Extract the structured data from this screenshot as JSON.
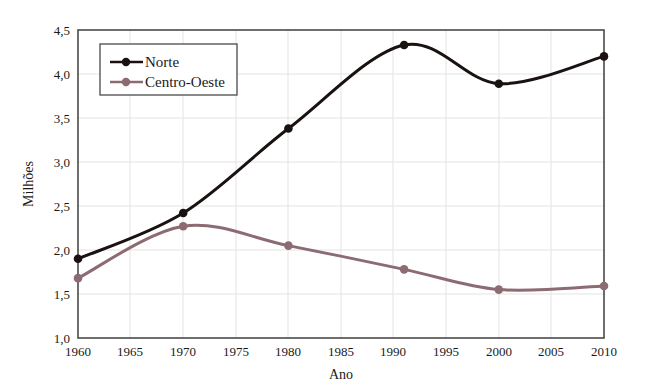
{
  "chart_data": {
    "type": "line",
    "title": "",
    "xlabel": "Ano",
    "ylabel": "Milhões",
    "xlim": [
      1960,
      2010
    ],
    "ylim": [
      1.0,
      4.5
    ],
    "x_ticks": [
      "1960",
      "1965",
      "1970",
      "1975",
      "1980",
      "1985",
      "1990",
      "1995",
      "2000",
      "2005",
      "2010"
    ],
    "y_ticks": [
      "1,0",
      "1,5",
      "2,0",
      "2,5",
      "3,0",
      "3,5",
      "4,0",
      "4,5"
    ],
    "grid": true,
    "legend_position": "top-left",
    "x": [
      1960,
      1970,
      1980,
      1991,
      2000,
      2010
    ],
    "series": [
      {
        "name": "Norte",
        "color": "#1a1210",
        "marker": "circle",
        "values": [
          1.9,
          2.42,
          3.38,
          4.33,
          3.89,
          4.2
        ]
      },
      {
        "name": "Centro-Oeste",
        "color": "#8d6b72",
        "marker": "circle",
        "values": [
          1.68,
          2.27,
          2.05,
          1.78,
          1.55,
          1.59
        ]
      }
    ]
  },
  "legend": {
    "entries": [
      {
        "label": "Norte"
      },
      {
        "label": "Centro-Oeste"
      }
    ]
  },
  "axes": {
    "x_title": "Ano",
    "y_title": "Milhões"
  },
  "colors": {
    "norte": "#1a1210",
    "centro_oeste": "#8d6b72",
    "grid": "#e3e3e6",
    "frame": "#4a4a4a",
    "background": "#ffffff"
  }
}
